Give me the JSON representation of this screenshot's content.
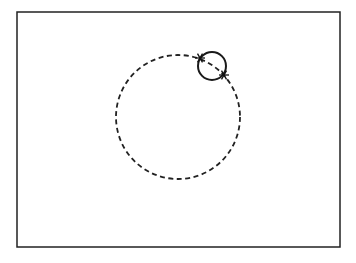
{
  "diagram": {
    "frame": {
      "x": 17,
      "y": 12,
      "width": 323,
      "height": 235,
      "stroke": "#222222",
      "stroke_width": 1.5
    },
    "dashed_circle": {
      "cx": 178,
      "cy": 117,
      "r": 62,
      "stroke": "#222222",
      "stroke_width": 1.8,
      "dash": "5 3.5"
    },
    "solid_circle": {
      "cx": 212,
      "cy": 66,
      "r": 14,
      "stroke": "#1a1a1a",
      "stroke_width": 2
    },
    "intersection_markers": [
      {
        "x": 200,
        "y": 58,
        "shape": "asterisk"
      },
      {
        "x": 224,
        "y": 75,
        "shape": "asterisk"
      }
    ]
  }
}
